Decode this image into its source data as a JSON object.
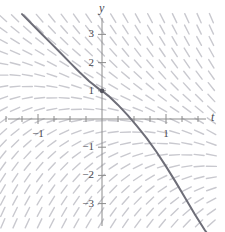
{
  "figure": {
    "title": "",
    "axis_labels": {
      "x": "t",
      "y": "y"
    },
    "colors": {
      "axis": "#8c8c8c",
      "slope_dash": "#c9c9cf",
      "solution_curve": "#6e6e78",
      "initial_point": "#55555f",
      "background": "#ffffff",
      "text": "#4a4a52"
    }
  },
  "ticks": {
    "x_labeled": [
      {
        "value": -1,
        "label": "−1"
      },
      {
        "value": 1,
        "label": "1"
      }
    ],
    "y_labeled": [
      {
        "value": 3,
        "label": "3"
      },
      {
        "value": 2,
        "label": "2"
      },
      {
        "value": 1,
        "label": "1"
      },
      {
        "value": -1,
        "label": "−1"
      },
      {
        "value": -2,
        "label": "−2"
      },
      {
        "value": -3,
        "label": "−3"
      }
    ]
  },
  "chart_data": {
    "type": "line",
    "title": "",
    "subtitle": "",
    "xlabel": "t",
    "ylabel": "y",
    "xlim": [
      -1.62,
      1.88
    ],
    "ylim": [
      -3.85,
      3.75
    ],
    "grid": false,
    "legend": null,
    "annotations": [
      {
        "kind": "initial-condition-point",
        "x": 0,
        "y": 1,
        "label": ""
      }
    ],
    "series": [
      {
        "name": "solution curve",
        "kind": "solution-curve",
        "x": [
          -1.25,
          -1.1,
          -0.95,
          -0.8,
          -0.65,
          -0.5,
          -0.35,
          -0.2,
          -0.05,
          0,
          0.1,
          0.25,
          0.4,
          0.55,
          0.7,
          0.85,
          1.0,
          1.15,
          1.3,
          1.45,
          1.6,
          1.72
        ],
        "y": [
          3.72,
          3.38,
          3.03,
          2.69,
          2.35,
          2.0,
          1.66,
          1.34,
          1.07,
          1.0,
          0.82,
          0.5,
          0.14,
          -0.26,
          -0.69,
          -1.16,
          -1.68,
          -2.23,
          -2.8,
          -3.38,
          -3.92,
          -4.3
        ]
      }
    ],
    "slope_field": {
      "description": "dash marks indicating solution slopes on a grid",
      "x_range": [
        -1.55,
        1.85
      ],
      "y_range": [
        -3.7,
        3.6
      ],
      "x_step": 0.1917,
      "y_step": 0.4042,
      "dash_length_px": 10,
      "slope_rule": "-(t + y)"
    }
  }
}
